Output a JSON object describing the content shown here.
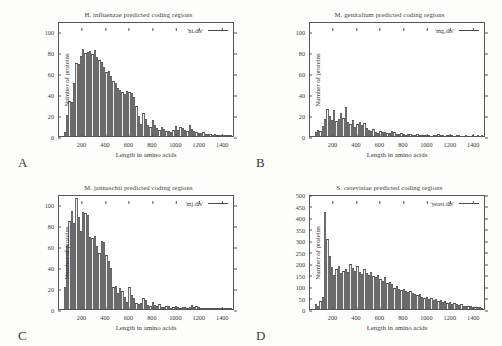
{
  "figure": {
    "axis_labels": {
      "x": "Length in amino acids",
      "y": "Number of proteins"
    }
  },
  "chart_data": [
    {
      "panel": "A",
      "type": "bar",
      "title": "H. influenzae predicted coding regions",
      "legend": "'hi.dis'",
      "xlabel": "Length in amino acids",
      "ylabel": "Number of proteins",
      "xlim": [
        0,
        1500
      ],
      "ylim": [
        0,
        110
      ],
      "xticks": [
        200,
        400,
        600,
        800,
        1000,
        1200,
        1400
      ],
      "yticks": [
        0,
        20,
        40,
        60,
        80,
        100
      ],
      "bin_width": 20,
      "bin_starts": [
        0,
        20,
        40,
        60,
        80,
        100,
        120,
        140,
        160,
        180,
        200,
        220,
        240,
        260,
        280,
        300,
        320,
        340,
        360,
        380,
        400,
        420,
        440,
        460,
        480,
        500,
        520,
        540,
        560,
        580,
        600,
        620,
        640,
        660,
        680,
        700,
        720,
        740,
        760,
        780,
        800,
        820,
        840,
        860,
        880,
        900,
        920,
        940,
        960,
        980,
        1000,
        1020,
        1040,
        1060,
        1080,
        1100,
        1120,
        1140,
        1160,
        1180,
        1200,
        1220,
        1240,
        1260,
        1280,
        1300,
        1320,
        1340,
        1360,
        1380,
        1400,
        1420,
        1440,
        1460,
        1480
      ],
      "values": [
        0,
        0,
        4,
        20,
        34,
        33,
        52,
        71,
        70,
        78,
        85,
        81,
        82,
        83,
        80,
        84,
        77,
        74,
        72,
        67,
        62,
        63,
        58,
        54,
        52,
        47,
        45,
        43,
        41,
        44,
        43,
        42,
        38,
        29,
        19,
        12,
        22,
        17,
        11,
        9,
        16,
        11,
        8,
        6,
        9,
        7,
        5,
        5,
        4,
        6,
        10,
        6,
        9,
        8,
        6,
        5,
        11,
        7,
        5,
        4,
        3,
        3,
        4,
        2,
        2,
        2,
        1,
        2,
        1,
        1,
        1,
        1,
        1,
        1,
        1
      ]
    },
    {
      "panel": "B",
      "type": "bar",
      "title": "M. genitalium predicted coding regions",
      "legend": "'mg.dis'",
      "xlabel": "Length in amino acids",
      "ylabel": "Number of proteins",
      "xlim": [
        0,
        1500
      ],
      "ylim": [
        0,
        110
      ],
      "xticks": [
        200,
        400,
        600,
        800,
        1000,
        1200,
        1400
      ],
      "yticks": [
        0,
        20,
        40,
        60,
        80,
        100
      ],
      "bin_width": 20,
      "bin_starts": [
        0,
        20,
        40,
        60,
        80,
        100,
        120,
        140,
        160,
        180,
        200,
        220,
        240,
        260,
        280,
        300,
        320,
        340,
        360,
        380,
        400,
        420,
        440,
        460,
        480,
        500,
        520,
        540,
        560,
        580,
        600,
        620,
        640,
        660,
        680,
        700,
        720,
        740,
        760,
        780,
        800,
        820,
        840,
        860,
        880,
        900,
        920,
        940,
        960,
        980,
        1000,
        1020,
        1040,
        1060,
        1080,
        1100,
        1120,
        1140,
        1160,
        1180,
        1200,
        1220,
        1240,
        1260,
        1280,
        1300,
        1320,
        1340,
        1360,
        1380,
        1400,
        1420,
        1440,
        1460,
        1480
      ],
      "values": [
        0,
        0,
        4,
        6,
        5,
        10,
        17,
        26,
        19,
        16,
        25,
        15,
        17,
        22,
        18,
        28,
        14,
        12,
        16,
        9,
        12,
        14,
        11,
        13,
        8,
        6,
        5,
        7,
        4,
        3,
        5,
        4,
        4,
        3,
        3,
        5,
        4,
        2,
        2,
        3,
        2,
        1,
        2,
        2,
        1,
        1,
        2,
        1,
        1,
        1,
        1,
        1,
        0,
        1,
        1,
        2,
        1,
        1,
        0,
        1,
        1,
        1,
        0,
        1,
        1,
        0,
        0,
        1,
        0,
        0,
        1,
        0,
        1,
        0,
        1
      ]
    },
    {
      "panel": "C",
      "type": "bar",
      "title": "M. jannaschii predicted coding regions",
      "legend": "'mj.dis'",
      "xlabel": "Length in amino acids",
      "ylabel": "Number of proteins",
      "xlim": [
        0,
        1500
      ],
      "ylim": [
        0,
        110
      ],
      "xticks": [
        200,
        400,
        600,
        800,
        1000,
        1200,
        1400
      ],
      "yticks": [
        0,
        20,
        40,
        60,
        80,
        100
      ],
      "bin_width": 20,
      "bin_starts": [
        0,
        20,
        40,
        60,
        80,
        100,
        120,
        140,
        160,
        180,
        200,
        220,
        240,
        260,
        280,
        300,
        320,
        340,
        360,
        380,
        400,
        420,
        440,
        460,
        480,
        500,
        520,
        540,
        560,
        580,
        600,
        620,
        640,
        660,
        680,
        700,
        720,
        740,
        760,
        780,
        800,
        820,
        840,
        860,
        880,
        900,
        920,
        940,
        960,
        980,
        1000,
        1020,
        1040,
        1060,
        1080,
        1100,
        1120,
        1140,
        1160,
        1180,
        1200,
        1220,
        1240,
        1260,
        1280,
        1300,
        1320,
        1340,
        1360,
        1380,
        1400,
        1420,
        1440,
        1460,
        1480
      ],
      "values": [
        0,
        0,
        21,
        61,
        86,
        95,
        84,
        108,
        90,
        76,
        94,
        93,
        92,
        70,
        69,
        71,
        61,
        55,
        66,
        65,
        53,
        47,
        40,
        21,
        22,
        16,
        20,
        18,
        12,
        7,
        21,
        14,
        11,
        6,
        5,
        6,
        11,
        9,
        4,
        3,
        7,
        4,
        3,
        5,
        2,
        2,
        3,
        3,
        1,
        2,
        3,
        2,
        1,
        2,
        2,
        1,
        2,
        4,
        2,
        3,
        2,
        1,
        1,
        1,
        1,
        1,
        1,
        1,
        1,
        1,
        1,
        1,
        1,
        1,
        1
      ]
    },
    {
      "panel": "D",
      "type": "bar",
      "title": "S. cerevisiae predicted coding regions",
      "legend": "'yeast.dis'",
      "xlabel": "Length in amino acids",
      "ylabel": "Number of proteins",
      "xlim": [
        0,
        1500
      ],
      "ylim": [
        0,
        500
      ],
      "xticks": [
        200,
        400,
        600,
        800,
        1000,
        1200,
        1400
      ],
      "yticks": [
        0,
        50,
        100,
        150,
        200,
        250,
        300,
        350,
        400,
        450,
        500
      ],
      "bin_width": 20,
      "bin_starts": [
        0,
        20,
        40,
        60,
        80,
        100,
        120,
        140,
        160,
        180,
        200,
        220,
        240,
        260,
        280,
        300,
        320,
        340,
        360,
        380,
        400,
        420,
        440,
        460,
        480,
        500,
        520,
        540,
        560,
        580,
        600,
        620,
        640,
        660,
        680,
        700,
        720,
        740,
        760,
        780,
        800,
        820,
        840,
        860,
        880,
        900,
        920,
        940,
        960,
        980,
        1000,
        1020,
        1040,
        1060,
        1080,
        1100,
        1120,
        1140,
        1160,
        1180,
        1200,
        1220,
        1240,
        1260,
        1280,
        1300,
        1320,
        1340,
        1360,
        1380,
        1400,
        1420,
        1440,
        1460,
        1480
      ],
      "values": [
        0,
        0,
        20,
        12,
        35,
        55,
        428,
        308,
        235,
        185,
        150,
        175,
        190,
        160,
        170,
        175,
        165,
        200,
        180,
        170,
        190,
        165,
        155,
        175,
        160,
        150,
        165,
        145,
        140,
        150,
        135,
        125,
        140,
        115,
        120,
        110,
        95,
        100,
        90,
        85,
        90,
        80,
        75,
        80,
        70,
        65,
        60,
        65,
        55,
        50,
        55,
        45,
        50,
        40,
        45,
        35,
        40,
        30,
        35,
        25,
        30,
        22,
        25,
        20,
        18,
        20,
        15,
        14,
        12,
        12,
        10,
        9,
        8,
        7,
        6
      ]
    }
  ]
}
